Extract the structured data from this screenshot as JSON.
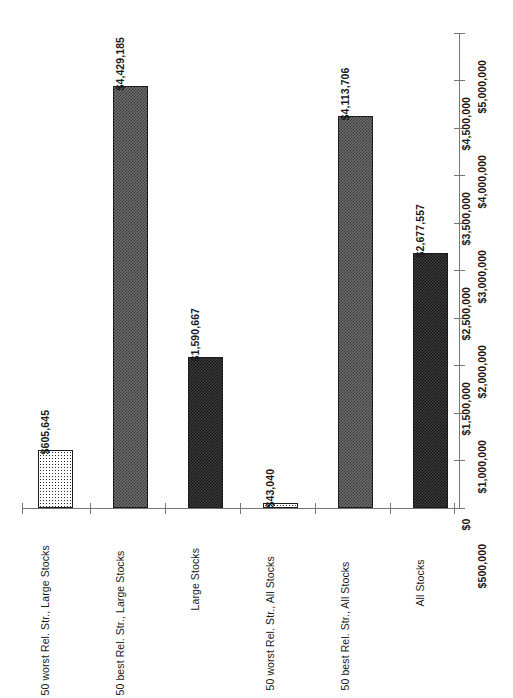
{
  "chart_data": {
    "type": "bar",
    "title": "",
    "subtitle": "",
    "xlabel": "",
    "ylabel": "",
    "orientation": "vertical",
    "grid": false,
    "legend": false,
    "legend_position": "none",
    "axis_orientation": "y-axis on right, all labels rotated 90 degrees",
    "ylim": [
      0,
      5000000
    ],
    "ytick_step": 500000,
    "ytick_labels": [
      "$0",
      "$500,000",
      "$1,000,000",
      "$1,500,000",
      "$2,000,000",
      "$2,500,000",
      "$3,000,000",
      "$3,500,000",
      "$4,000,000",
      "$4,500,000",
      "$5,000,000"
    ],
    "ytick_values": [
      0,
      500000,
      1000000,
      1500000,
      2000000,
      2500000,
      3000000,
      3500000,
      4000000,
      4500000,
      5000000
    ],
    "categories": [
      "50 worst Rel. Str., Large Stocks",
      "50 best Rel. Str., Large Stocks",
      "Large Stocks",
      "50 worst Rel. Str., All Stocks",
      "50 best Rel. Str., All Stocks",
      "All Stocks"
    ],
    "values": [
      605645,
      4429185,
      1590667,
      43040,
      4113706,
      2677557
    ],
    "value_labels": [
      "$605,645",
      "$4,429,185",
      "$1,590,667",
      "$43,040",
      "$4,113,706",
      "$2,677,557"
    ],
    "bar_fills": [
      "dots",
      "check-mid",
      "check-dark",
      "dots",
      "check-mid",
      "check-dark"
    ],
    "colors": {
      "axis": "#767676",
      "bar_outline": "#1c1c1c",
      "fill_light": "#ffffff",
      "fill_mid": "#6d6d6d",
      "fill_dark": "#3b3b3b",
      "text": "#1a1a1a",
      "background": "#ffffff"
    }
  }
}
